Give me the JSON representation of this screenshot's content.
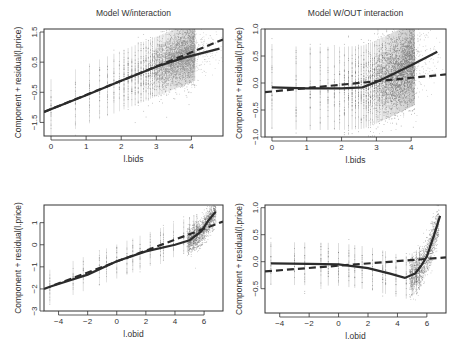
{
  "chart_data": [
    {
      "type": "scatter",
      "panel": "top-left",
      "title": "Model W/interaction",
      "xlabel": "l.bids",
      "ylabel": "Component + residual(l.price)",
      "x_ticks": [
        0,
        1,
        2,
        3,
        4
      ],
      "y_ticks": [
        -1.5,
        -0.5,
        0.5,
        1.5
      ],
      "y_tick_labels": [
        "-1.5",
        "-0.5",
        "0.5",
        "1.5"
      ],
      "xlim": [
        -0.2,
        4.9
      ],
      "ylim": [
        -1.95,
        1.6
      ],
      "grid": false,
      "series": [
        {
          "name": "residual points",
          "style": "scatter"
        },
        {
          "name": "component (linear fit)",
          "style": "dashed",
          "x": [
            -0.2,
            4.9
          ],
          "y": [
            -1.15,
            1.25
          ]
        },
        {
          "name": "smooth fit",
          "style": "solid",
          "x": [
            -0.2,
            1,
            2,
            3,
            3.8,
            4.8
          ],
          "y": [
            -1.15,
            -0.6,
            -0.12,
            0.35,
            0.65,
            0.95
          ]
        }
      ]
    },
    {
      "type": "scatter",
      "panel": "top-right",
      "title": "Model W/OUT interaction",
      "xlabel": "l.bids",
      "ylabel": "Component + residual(l.price)",
      "x_ticks": [
        0,
        1,
        2,
        3,
        4
      ],
      "y_ticks": [
        -1.0,
        -0.5,
        0.0,
        0.5,
        1.0
      ],
      "y_tick_labels": [
        "-1.0",
        "-0.5",
        "0.0",
        "0.5",
        "1.0"
      ],
      "xlim": [
        -0.2,
        5.0
      ],
      "ylim": [
        -1.0,
        1.0
      ],
      "grid": false,
      "series": [
        {
          "name": "residual points",
          "style": "scatter"
        },
        {
          "name": "component (linear fit)",
          "style": "dashed",
          "x": [
            -0.2,
            5.0
          ],
          "y": [
            -0.17,
            0.16
          ]
        },
        {
          "name": "smooth fit",
          "style": "solid",
          "x": [
            0,
            1,
            2,
            2.6,
            3,
            3.5,
            4,
            4.75
          ],
          "y": [
            -0.08,
            -0.1,
            -0.1,
            -0.08,
            0.02,
            0.17,
            0.33,
            0.58
          ]
        }
      ]
    },
    {
      "type": "scatter",
      "panel": "bottom-left",
      "title": "",
      "xlabel": "l.obid",
      "ylabel": "Component + residual(l.price)",
      "x_ticks": [
        -4,
        -2,
        0,
        2,
        4,
        6
      ],
      "y_ticks": [
        -3,
        -2,
        -1,
        0,
        1
      ],
      "y_tick_labels": [
        "-3",
        "-2",
        "-1",
        "0",
        "1"
      ],
      "xlim": [
        -5.0,
        7.3
      ],
      "ylim": [
        -3.0,
        1.8
      ],
      "grid": false,
      "series": [
        {
          "name": "residual points",
          "style": "scatter"
        },
        {
          "name": "component (linear fit)",
          "style": "dashed",
          "x": [
            -5.0,
            7.3
          ],
          "y": [
            -2.0,
            1.05
          ]
        },
        {
          "name": "smooth fit",
          "style": "solid",
          "x": [
            -4.6,
            -2,
            0,
            2,
            4,
            5,
            5.8,
            6.3,
            6.8
          ],
          "y": [
            -1.9,
            -1.35,
            -0.75,
            -0.3,
            0.0,
            0.2,
            0.6,
            1.1,
            1.5
          ]
        }
      ]
    },
    {
      "type": "scatter",
      "panel": "bottom-right",
      "title": "",
      "xlabel": "l.obid",
      "ylabel": "Component + residual(l.price)",
      "x_ticks": [
        -4,
        -2,
        0,
        2,
        4,
        6
      ],
      "y_ticks": [
        -0.5,
        0.0,
        0.5,
        1.0
      ],
      "y_tick_labels": [
        "-0.5",
        "0.0",
        "0.5",
        "1.0"
      ],
      "xlim": [
        -5.0,
        7.3
      ],
      "ylim": [
        -0.95,
        1.05
      ],
      "grid": false,
      "series": [
        {
          "name": "residual points",
          "style": "scatter"
        },
        {
          "name": "component (linear fit)",
          "style": "dashed",
          "x": [
            -5.0,
            7.3
          ],
          "y": [
            -0.18,
            0.08
          ]
        },
        {
          "name": "smooth fit",
          "style": "solid",
          "x": [
            -4.6,
            -2,
            0,
            2,
            3.5,
            4.5,
            5.2,
            5.6,
            6.0,
            6.5,
            6.9
          ],
          "y": [
            -0.03,
            -0.04,
            -0.05,
            -0.12,
            -0.22,
            -0.3,
            -0.22,
            -0.08,
            0.1,
            0.5,
            0.85
          ]
        }
      ]
    }
  ]
}
